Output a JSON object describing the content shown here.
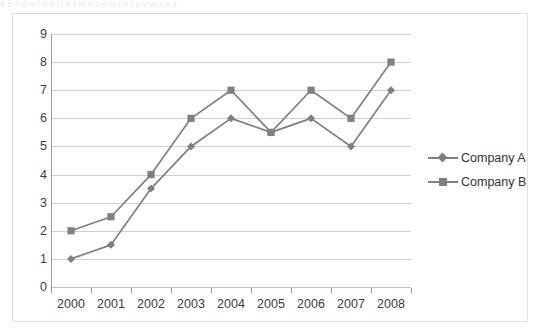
{
  "figure": {
    "clipped_text_above": "a b c d e f g h i j k l m n o p q r s t u v w x y z",
    "frame_color": "#e2e2e4",
    "background": "#ffffff"
  },
  "chart_data": {
    "type": "line",
    "title": "",
    "xlabel": "",
    "ylabel": "",
    "categories": [
      "2000",
      "2001",
      "2002",
      "2003",
      "2004",
      "2005",
      "2006",
      "2007",
      "2008"
    ],
    "series": [
      {
        "name": "Company A",
        "marker": "diamond",
        "color": "#808080",
        "values": [
          1,
          1.5,
          3.5,
          5,
          6,
          5.5,
          6,
          5,
          7
        ]
      },
      {
        "name": "Company B",
        "marker": "square",
        "color": "#808080",
        "values": [
          2,
          2.5,
          4,
          6,
          7,
          5.5,
          7,
          6,
          8
        ]
      }
    ],
    "ylim": [
      0,
      9
    ],
    "ytick_labels": [
      "0",
      "1",
      "2",
      "3",
      "4",
      "5",
      "6",
      "7",
      "8",
      "9"
    ],
    "ytick_values": [
      0,
      1,
      2,
      3,
      4,
      5,
      6,
      7,
      8,
      9
    ],
    "grid": true,
    "grid_axis": "y",
    "grid_color": "#d0d0d4",
    "axis_color": "#9a9a9e",
    "legend": true,
    "legend_position": "right",
    "legend_entries": [
      "Company A",
      "Company B"
    ]
  }
}
